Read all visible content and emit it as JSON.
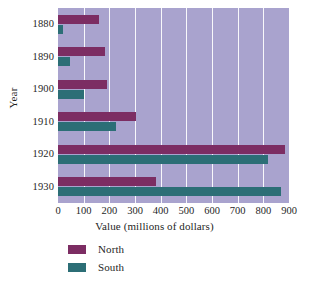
{
  "chart": {
    "type": "bar",
    "orientation": "horizontal",
    "xlabel": "Value (millions of dollars)",
    "ylabel": "Year"
  },
  "chart_data": {
    "type": "bar",
    "title": "",
    "subtitle": "",
    "xlabel": "Value (millions of dollars)",
    "ylabel": "Year",
    "orientation": "horizontal",
    "categories": [
      "1880",
      "1890",
      "1900",
      "1910",
      "1920",
      "1930"
    ],
    "series": [
      {
        "name": "North",
        "color": "#7c2d63",
        "values": [
          160,
          185,
          190,
          305,
          885,
          380
        ]
      },
      {
        "name": "South",
        "color": "#2c6e76",
        "values": [
          20,
          45,
          100,
          225,
          820,
          870
        ]
      }
    ],
    "xlim": [
      0,
      900
    ],
    "xticks": [
      0,
      100,
      200,
      300,
      400,
      500,
      600,
      700,
      800,
      900
    ],
    "xtick_labels": [
      "0",
      "100",
      "200",
      "300",
      "400",
      "500",
      "600",
      "700",
      "800",
      "900"
    ],
    "grid": "vertical-white-gridlines",
    "plot_background": "#a9a3ce",
    "legend": {
      "position": "below-axis-left",
      "entries": [
        {
          "label": "North",
          "color": "#7c2d63"
        },
        {
          "label": "South",
          "color": "#2c6e76"
        }
      ]
    }
  }
}
